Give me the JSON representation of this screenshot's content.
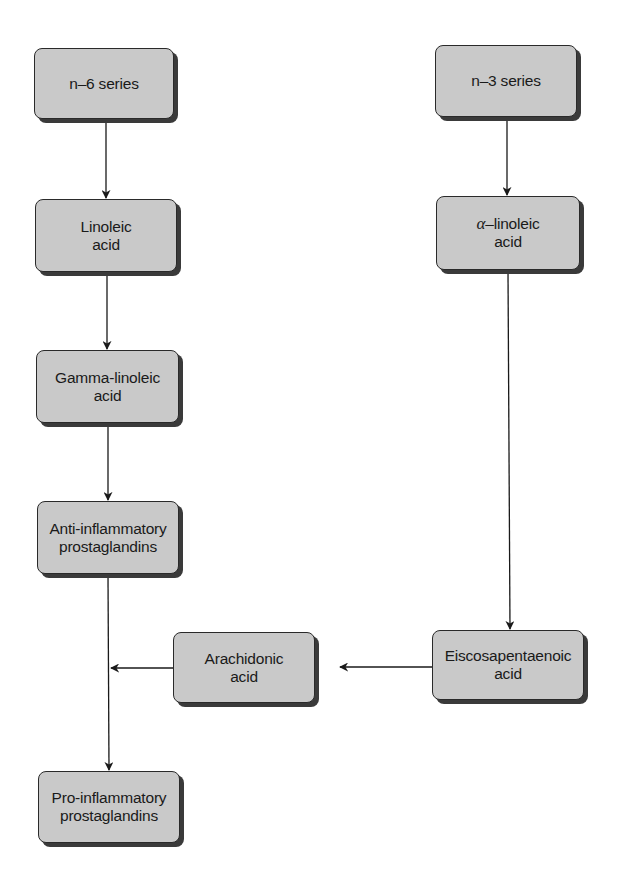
{
  "diagram": {
    "type": "flowchart",
    "colors": {
      "background": "#ffffff",
      "node_fill": "#c9c9c9",
      "node_border": "#2a2a2a",
      "node_shadow": "#3a3a3a",
      "edge": "#1a1a1a",
      "text": "#1a1a1a"
    },
    "nodes": [
      {
        "id": "n6",
        "label": "n–6 series",
        "lines": [
          "n–6 series"
        ]
      },
      {
        "id": "linoleic",
        "label": "Linoleic acid",
        "lines": [
          "Linoleic",
          "acid"
        ]
      },
      {
        "id": "gamma",
        "label": "Gamma-linoleic acid",
        "lines": [
          "Gamma-linoleic",
          "acid"
        ]
      },
      {
        "id": "anti",
        "label": "Anti-inflammatory prostaglandins",
        "lines": [
          "Anti-inflammatory",
          "prostaglandins"
        ]
      },
      {
        "id": "pro",
        "label": "Pro-inflammatory prostaglandins",
        "lines": [
          "Pro-inflammatory",
          "prostaglandins"
        ]
      },
      {
        "id": "n3",
        "label": "n–3 series",
        "lines": [
          "n–3 series"
        ]
      },
      {
        "id": "alpha",
        "label": "α–linoleic acid",
        "greek_prefix": "α",
        "lines": [
          "–linoleic",
          "acid"
        ]
      },
      {
        "id": "epa",
        "label": "Eiscosapentaenoic acid",
        "lines": [
          "Eiscosapentaenoic",
          "acid"
        ]
      },
      {
        "id": "arachidonic",
        "label": "Arachidonic acid",
        "lines": [
          "Arachidonic",
          "acid"
        ]
      }
    ],
    "edges": [
      {
        "from": "n6",
        "to": "linoleic"
      },
      {
        "from": "linoleic",
        "to": "gamma"
      },
      {
        "from": "gamma",
        "to": "anti"
      },
      {
        "from": "anti",
        "to": "pro"
      },
      {
        "from": "n3",
        "to": "alpha"
      },
      {
        "from": "alpha",
        "to": "epa"
      },
      {
        "from": "epa",
        "to": "arachidonic"
      },
      {
        "from": "arachidonic",
        "to": "anti-pro-line"
      }
    ]
  }
}
